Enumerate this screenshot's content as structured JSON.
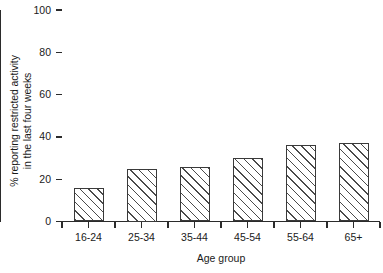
{
  "chart_data": {
    "type": "bar",
    "title": "",
    "categories": [
      "16-24",
      "25-34",
      "35-44",
      "45-54",
      "55-64",
      "65+"
    ],
    "values": [
      16,
      25,
      26,
      30,
      36,
      37
    ],
    "xlabel": "Age group",
    "ylabel": "% reporting restricted activity\nin the last four weeks",
    "ylim": [
      0,
      100
    ],
    "yticks": [
      0,
      20,
      40,
      60,
      80,
      100
    ],
    "ytick_labels": [
      "0",
      "20",
      "40",
      "60",
      "80",
      "100"
    ],
    "grid": false,
    "legend": false,
    "bar_fill": "hatched-diagonal",
    "bar_edge_color": "#3a3a3a",
    "axis_color": "#2b2b2b",
    "background_color": "#ffffff"
  }
}
